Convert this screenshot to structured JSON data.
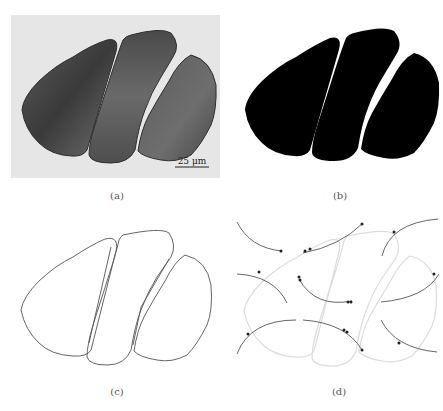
{
  "figure": {
    "panels": [
      {
        "id": "a",
        "label": "(a)",
        "type": "micrograph",
        "scale_bar": "25 μm"
      },
      {
        "id": "b",
        "label": "(b)",
        "type": "binary-segmentation"
      },
      {
        "id": "c",
        "label": "(c)",
        "type": "contour-outline"
      },
      {
        "id": "d",
        "label": "(d)",
        "type": "contour-with-circular-arcs-and-intersection-points"
      }
    ]
  },
  "colors": {
    "photo_background": "#e8e8e8",
    "cell_dark": "#3c3c3c",
    "cell_mid": "#6a6a6a",
    "binary_fill": "#000000",
    "outline": "#555555",
    "faint_outline": "#d8d8d8",
    "arc": "#555555",
    "point": "#222222"
  }
}
